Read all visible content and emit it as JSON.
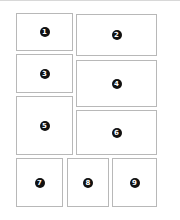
{
  "diagram": {
    "panels": [
      {
        "label": "1",
        "x": 16,
        "y": 13,
        "w": 57,
        "h": 38
      },
      {
        "label": "2",
        "x": 76,
        "y": 14,
        "w": 81,
        "h": 42
      },
      {
        "label": "3",
        "x": 16,
        "y": 54,
        "w": 57,
        "h": 39
      },
      {
        "label": "4",
        "x": 76,
        "y": 60,
        "w": 81,
        "h": 47
      },
      {
        "label": "5",
        "x": 16,
        "y": 96,
        "w": 57,
        "h": 59
      },
      {
        "label": "6",
        "x": 76,
        "y": 110,
        "w": 81,
        "h": 45
      },
      {
        "label": "7",
        "x": 16,
        "y": 158,
        "w": 47,
        "h": 49
      },
      {
        "label": "8",
        "x": 67,
        "y": 158,
        "w": 42,
        "h": 49
      },
      {
        "label": "9",
        "x": 112,
        "y": 158,
        "w": 45,
        "h": 49
      }
    ],
    "colors": {
      "border": "#b8b8b8",
      "badge": "#111111",
      "badge_text": "#ffffff"
    }
  }
}
